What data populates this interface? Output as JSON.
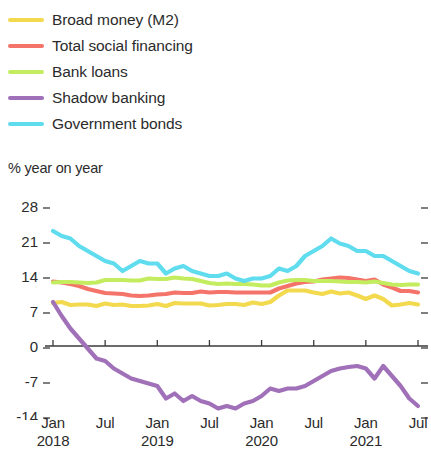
{
  "legend": {
    "items": [
      {
        "label": "Broad money (M2)",
        "color": "#F2D94E",
        "swatch_name": "legend-swatch-broad-money"
      },
      {
        "label": "Total social financing",
        "color": "#F4746A",
        "swatch_name": "legend-swatch-total-social-financing"
      },
      {
        "label": "Bank loans",
        "color": "#C3EC5E",
        "swatch_name": "legend-swatch-bank-loans"
      },
      {
        "label": "Shadow banking",
        "color": "#A070B8",
        "swatch_name": "legend-swatch-shadow-banking"
      },
      {
        "label": "Government bonds",
        "color": "#5FDCEE",
        "swatch_name": "legend-swatch-government-bonds"
      }
    ]
  },
  "axis": {
    "unit_label": "% year on year",
    "y_ticks": [
      "28",
      "21",
      "14",
      "7",
      "0",
      "-7",
      "-14"
    ],
    "x_ticks": [
      {
        "month": "Jan",
        "year": "2018"
      },
      {
        "month": "Jul",
        "year": ""
      },
      {
        "month": "Jan",
        "year": "2019"
      },
      {
        "month": "Jul",
        "year": ""
      },
      {
        "month": "Jan",
        "year": "2020"
      },
      {
        "month": "Jul",
        "year": ""
      },
      {
        "month": "Jan",
        "year": "2021"
      },
      {
        "month": "Jul",
        "year": ""
      }
    ]
  },
  "chart_data": {
    "type": "line",
    "title": "",
    "subtitle": "",
    "xlabel": "",
    "ylabel": "% year on year",
    "ylim": [
      -16.5,
      30
    ],
    "xlim": [
      0,
      42
    ],
    "grid": false,
    "legend_position": "top-left",
    "zero_line": 0,
    "x": [
      "Jan 2018",
      "Feb 2018",
      "Mar 2018",
      "Apr 2018",
      "May 2018",
      "Jun 2018",
      "Jul 2018",
      "Aug 2018",
      "Sep 2018",
      "Oct 2018",
      "Nov 2018",
      "Dec 2018",
      "Jan 2019",
      "Feb 2019",
      "Mar 2019",
      "Apr 2019",
      "May 2019",
      "Jun 2019",
      "Jul 2019",
      "Aug 2019",
      "Sep 2019",
      "Oct 2019",
      "Nov 2019",
      "Dec 2019",
      "Jan 2020",
      "Feb 2020",
      "Mar 2020",
      "Apr 2020",
      "May 2020",
      "Jun 2020",
      "Jul 2020",
      "Aug 2020",
      "Sep 2020",
      "Oct 2020",
      "Nov 2020",
      "Dec 2020",
      "Jan 2021",
      "Feb 2021",
      "Mar 2021",
      "Apr 2021",
      "May 2021",
      "Jun 2021",
      "Jul 2021"
    ],
    "series": [
      {
        "name": "Broad money (M2)",
        "color": "#F2D94E",
        "values": [
          8.6,
          8.8,
          8.2,
          8.3,
          8.3,
          8.0,
          8.5,
          8.2,
          8.3,
          8.0,
          8.0,
          8.1,
          8.4,
          8.0,
          8.6,
          8.5,
          8.5,
          8.5,
          8.1,
          8.2,
          8.4,
          8.4,
          8.2,
          8.7,
          8.4,
          8.8,
          10.1,
          11.1,
          11.1,
          11.1,
          10.7,
          10.4,
          10.9,
          10.5,
          10.7,
          10.1,
          9.4,
          10.1,
          9.4,
          8.1,
          8.3,
          8.6,
          8.3
        ]
      },
      {
        "name": "Total social financing",
        "color": "#F4746A",
        "values": [
          12.9,
          12.7,
          12.4,
          12.0,
          11.4,
          11.0,
          10.6,
          10.5,
          10.4,
          10.1,
          10.0,
          10.1,
          10.3,
          10.4,
          10.7,
          10.6,
          10.6,
          10.9,
          10.7,
          10.8,
          10.8,
          10.7,
          10.7,
          10.7,
          10.7,
          10.7,
          11.5,
          12.0,
          12.5,
          12.8,
          12.9,
          13.3,
          13.5,
          13.7,
          13.6,
          13.3,
          13.0,
          13.3,
          12.3,
          11.7,
          11.0,
          11.0,
          10.7
        ]
      },
      {
        "name": "Bank loans",
        "color": "#C3EC5E",
        "values": [
          12.7,
          12.8,
          12.8,
          12.7,
          12.6,
          12.7,
          13.2,
          13.2,
          13.2,
          13.1,
          13.1,
          13.5,
          13.4,
          13.4,
          13.7,
          13.5,
          13.4,
          13.0,
          12.6,
          12.4,
          12.5,
          12.4,
          12.4,
          12.3,
          12.1,
          12.1,
          12.7,
          13.1,
          13.2,
          13.2,
          13.0,
          13.0,
          13.0,
          12.9,
          12.8,
          12.8,
          12.7,
          12.9,
          12.6,
          12.3,
          12.2,
          12.3,
          12.3
        ]
      },
      {
        "name": "Shadow banking",
        "color": "#A070B8",
        "values": [
          8.8,
          6.0,
          3.5,
          1.5,
          -0.5,
          -2.5,
          -3.0,
          -4.5,
          -5.5,
          -6.5,
          -7.0,
          -7.5,
          -8.0,
          -10.5,
          -9.5,
          -11.0,
          -10.0,
          -11.0,
          -11.5,
          -12.5,
          -12.0,
          -12.5,
          -11.5,
          -11.0,
          -10.0,
          -8.5,
          -9.0,
          -8.5,
          -8.5,
          -8.0,
          -7.0,
          -6.0,
          -5.0,
          -4.5,
          -4.2,
          -4.0,
          -4.5,
          -6.5,
          -4.0,
          -6.0,
          -8.0,
          -10.5,
          -12.0
        ]
      },
      {
        "name": "Government bonds",
        "color": "#5FDCEE",
        "values": [
          23.0,
          22.0,
          21.5,
          20.0,
          19.0,
          18.0,
          17.0,
          16.5,
          15.0,
          16.0,
          17.0,
          16.5,
          16.5,
          14.5,
          15.5,
          16.0,
          15.0,
          14.5,
          14.0,
          14.0,
          14.5,
          13.5,
          13.0,
          13.5,
          13.5,
          14.0,
          15.5,
          15.0,
          16.0,
          18.0,
          19.0,
          20.0,
          21.5,
          20.5,
          20.0,
          19.0,
          19.0,
          18.0,
          18.0,
          17.0,
          16.0,
          15.0,
          14.5
        ]
      }
    ]
  }
}
